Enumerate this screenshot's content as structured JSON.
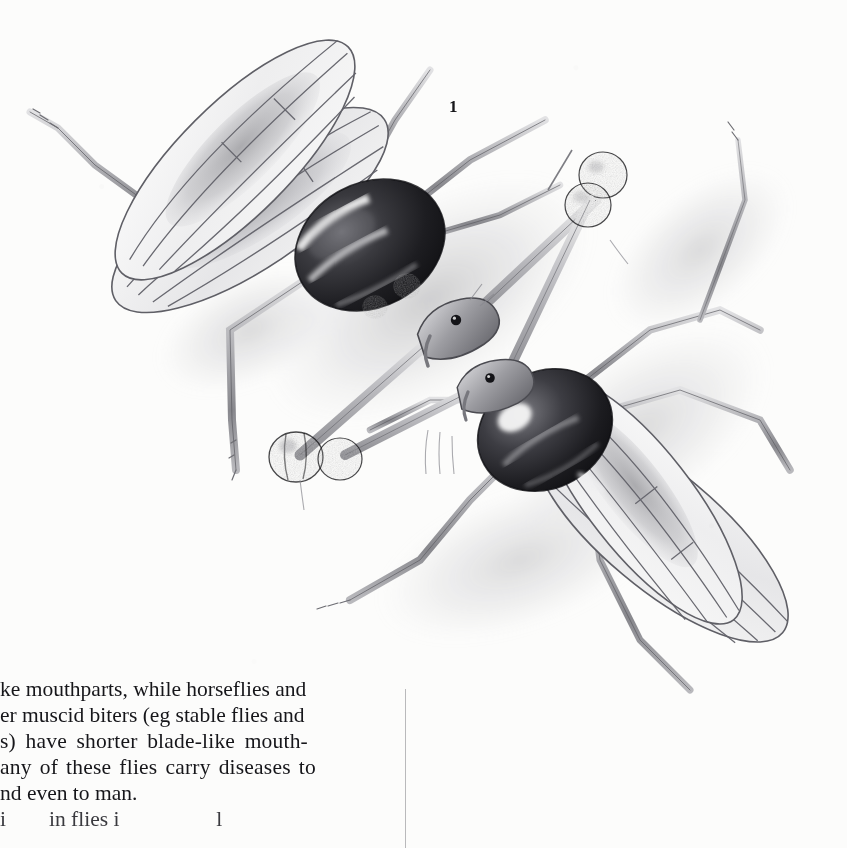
{
  "page": {
    "kind": "book-page-scan",
    "background_color": "#fcfcfb",
    "ink_color": "#16161a"
  },
  "figure": {
    "number_label": "1",
    "medium": "graphite pencil illustration",
    "caption_present": false,
    "elements": [
      {
        "name": "upper-left-fly",
        "parts": [
          "two translucent veined wings",
          "dark banded thorax",
          "long eye stalks with dark knobbed eyes",
          "slender legs",
          "antennae"
        ]
      },
      {
        "name": "lower-right-fly",
        "parts": [
          "two translucent veined wings",
          "dark thorax with pale spot",
          "long eye stalks with dark knobbed eyes",
          "slender legs"
        ]
      },
      {
        "name": "ground-shadow",
        "parts": [
          "soft stippled graphite shading beneath both flies"
        ]
      }
    ],
    "eye_knobs": [
      {
        "id": "upper-right-knob-pair",
        "x": 600,
        "y": 180
      },
      {
        "id": "lower-left-knob",
        "x": 300,
        "y": 450
      }
    ]
  },
  "body_text": {
    "column_rule_visible": true,
    "left_clipped": true,
    "bottom_clipped": true,
    "lines": [
      "ke mouthparts, while horseflies and",
      "er muscid biters (eg stable flies and",
      "s) have shorter blade-like mouth-",
      "any of these flies carry diseases to",
      "nd even to man."
    ],
    "partial_last_line": "i        in flies i                  l"
  },
  "colors": {
    "paper": "#fcfcfb",
    "text": "#16161a",
    "rule": "#b9b9bb",
    "graphite_dark": "#1b1b1e",
    "graphite_mid": "#8b8b8f",
    "graphite_light": "#d6d6d8"
  }
}
